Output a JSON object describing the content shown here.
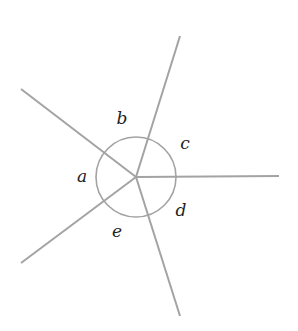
{
  "diagram": {
    "type": "angles-around-a-point",
    "center": {
      "x": 136,
      "y": 177
    },
    "arc_radius": 40,
    "stroke_color": "#a3a3a3",
    "label_color": "#222222",
    "rays": [
      {
        "name": "ray-upper-left",
        "end": {
          "x": 21,
          "y": 89
        }
      },
      {
        "name": "ray-up",
        "end": {
          "x": 180,
          "y": 36
        }
      },
      {
        "name": "ray-right",
        "end": {
          "x": 279,
          "y": 176
        }
      },
      {
        "name": "ray-down",
        "end": {
          "x": 180,
          "y": 316
        }
      },
      {
        "name": "ray-lower-left",
        "end": {
          "x": 21,
          "y": 263
        }
      }
    ],
    "labels": [
      {
        "text": "a",
        "x": 82,
        "y": 176
      },
      {
        "text": "b",
        "x": 122,
        "y": 118
      },
      {
        "text": "c",
        "x": 185,
        "y": 143
      },
      {
        "text": "d",
        "x": 181,
        "y": 210
      },
      {
        "text": "e",
        "x": 117,
        "y": 231
      }
    ]
  }
}
